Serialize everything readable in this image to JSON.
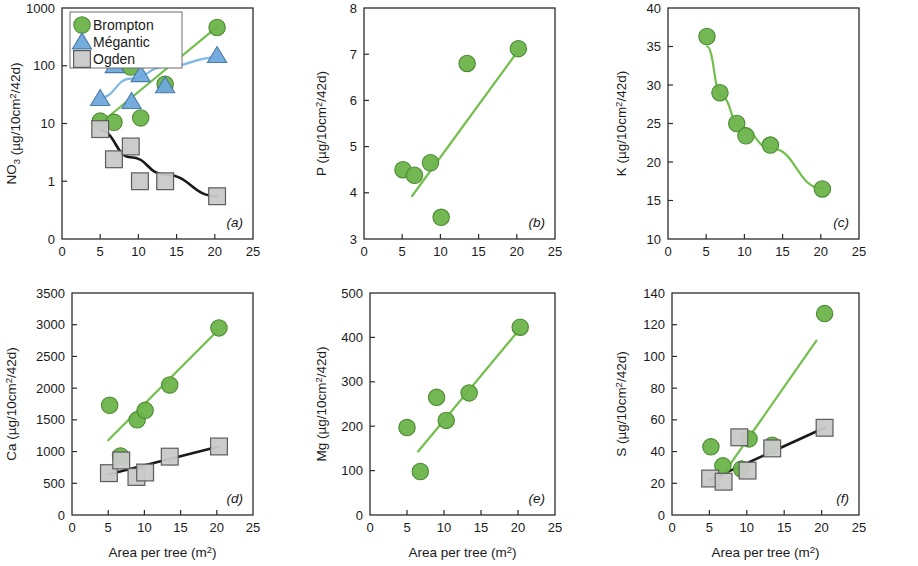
{
  "figure": {
    "xlabel": "Area per tree (m2)",
    "xlabel_base": "Area per tree (m",
    "xlabel_sup": "2",
    "xlabel_tail": ")",
    "unit_suffix": "g/10cm2/42d)",
    "legend": {
      "title": "",
      "items": [
        {
          "label": "Brompton",
          "marker": "circle",
          "color": "#6DB44A"
        },
        {
          "label": "Mégantic",
          "marker": "triangle",
          "color": "#6FA8DC"
        },
        {
          "label": "Ogden",
          "marker": "square",
          "color": "#C9C9C9"
        }
      ]
    }
  },
  "chart_data": [
    {
      "type": "scatter",
      "panel": "(a)",
      "title": "",
      "ylabel": "NO3 (µg/10cm2/42d)",
      "ylabel_parts": {
        "sym": "NO",
        "sub": "3",
        "rest": " (µg/10cm",
        "sup": "2",
        "tail": "/42d)"
      },
      "xlabel": "Area per tree (m2)",
      "xlim": [
        0,
        25
      ],
      "xticks": [
        0,
        5,
        10,
        15,
        20,
        25
      ],
      "yscale": "log-with-zero",
      "yticks": [
        0,
        1,
        10,
        100,
        1000
      ],
      "ytick_labels": [
        "0",
        "1",
        "10",
        "100",
        "1000"
      ],
      "ylim": [
        0.3,
        1000
      ],
      "grid": false,
      "series": [
        {
          "name": "Brompton",
          "marker": "circle",
          "color": "#6DB44A",
          "points": [
            [
              5.0,
              11.0
            ],
            [
              6.8,
              10.5
            ],
            [
              9.0,
              95.0
            ],
            [
              10.3,
              12.5
            ],
            [
              13.5,
              48.0
            ],
            [
              20.3,
              460.0
            ]
          ],
          "fit": {
            "type": "line",
            "x": [
              5.0,
              20.3
            ],
            "y": [
              10.0,
              470.0
            ]
          }
        },
        {
          "name": "Mégantic",
          "marker": "triangle",
          "color": "#6FA8DC",
          "points": [
            [
              5.0,
              27.0
            ],
            [
              6.9,
              100.0
            ],
            [
              9.1,
              24.0
            ],
            [
              10.3,
              70.0
            ],
            [
              13.5,
              45.0
            ],
            [
              20.3,
              150.0
            ]
          ],
          "fit": {
            "type": "curve",
            "x": [
              5.0,
              9.0,
              13.5,
              20.3
            ],
            "y": [
              28.0,
              60.0,
              95.0,
              140.0
            ]
          }
        },
        {
          "name": "Ogden",
          "marker": "square",
          "color": "#C9C9C9",
          "points": [
            [
              5.0,
              8.0
            ],
            [
              6.8,
              2.4
            ],
            [
              9.0,
              4.0
            ],
            [
              10.2,
              1.0
            ],
            [
              13.5,
              1.0
            ],
            [
              20.3,
              0.55
            ]
          ],
          "fit": {
            "type": "curve",
            "x": [
              5.0,
              9.0,
              13.5,
              20.3
            ],
            "y": [
              7.5,
              2.6,
              1.3,
              0.55
            ]
          }
        }
      ]
    },
    {
      "type": "scatter",
      "panel": "(b)",
      "title": "",
      "ylabel": "P (µg/10cm2/42d)",
      "ylabel_parts": {
        "sym": "P",
        "sub": "",
        "rest": " (µg/10cm",
        "sup": "2",
        "tail": "/42d)"
      },
      "xlabel": "Area per tree (m2)",
      "xlim": [
        0,
        25
      ],
      "xticks": [
        0,
        5,
        10,
        15,
        20,
        25
      ],
      "yscale": "linear",
      "ylim": [
        3,
        8
      ],
      "yticks": [
        3,
        4,
        5,
        6,
        7,
        8
      ],
      "ytick_labels": [
        "3",
        "4",
        "5",
        "6",
        "7",
        "8"
      ],
      "grid": false,
      "series": [
        {
          "name": "Brompton",
          "marker": "circle",
          "color": "#6DB44A",
          "points": [
            [
              5.1,
              4.5
            ],
            [
              6.6,
              4.38
            ],
            [
              8.7,
              4.65
            ],
            [
              10.1,
              3.47
            ],
            [
              13.5,
              6.8
            ],
            [
              20.2,
              7.12
            ]
          ],
          "fit": {
            "type": "line",
            "x": [
              6.3,
              20.2
            ],
            "y": [
              3.93,
              7.08
            ]
          }
        }
      ]
    },
    {
      "type": "scatter",
      "panel": "(c)",
      "title": "",
      "ylabel": "K (µg/10cm2/42d)",
      "ylabel_parts": {
        "sym": "K",
        "sub": "",
        "rest": " (µg/10cm",
        "sup": "2",
        "tail": "/42d)"
      },
      "xlabel": "Area per tree (m2)",
      "xlim": [
        0,
        25
      ],
      "xticks": [
        0,
        5,
        10,
        15,
        20,
        25
      ],
      "yscale": "linear",
      "ylim": [
        10,
        40
      ],
      "yticks": [
        10,
        15,
        20,
        25,
        30,
        35,
        40
      ],
      "ytick_labels": [
        "10",
        "15",
        "20",
        "25",
        "30",
        "35",
        "40"
      ],
      "grid": false,
      "series": [
        {
          "name": "Brompton",
          "marker": "circle",
          "color": "#6DB44A",
          "points": [
            [
              5.1,
              36.3
            ],
            [
              6.8,
              29.0
            ],
            [
              9.0,
              25.0
            ],
            [
              10.2,
              23.4
            ],
            [
              13.4,
              22.2
            ],
            [
              20.2,
              16.5
            ]
          ],
          "fit": {
            "type": "curve",
            "x": [
              5.1,
              7.0,
              9.5,
              13.4,
              20.2
            ],
            "y": [
              35.0,
              28.5,
              24.5,
              21.8,
              16.6
            ]
          }
        }
      ]
    },
    {
      "type": "scatter",
      "panel": "(d)",
      "title": "",
      "ylabel": "Ca (µg/10cm2/42d)",
      "ylabel_parts": {
        "sym": "Ca",
        "sub": "",
        "rest": " (µg/10cm",
        "sup": "2",
        "tail": "/42d)"
      },
      "xlabel": "Area per tree (m2)",
      "xlim": [
        0,
        25
      ],
      "xticks": [
        0,
        5,
        10,
        15,
        20,
        25
      ],
      "yscale": "linear",
      "ylim": [
        0,
        3500
      ],
      "yticks": [
        0,
        500,
        1000,
        1500,
        2000,
        2500,
        3000,
        3500
      ],
      "ytick_labels": [
        "0",
        "500",
        "1000",
        "1500",
        "2000",
        "2500",
        "3000",
        "3500"
      ],
      "grid": false,
      "series": [
        {
          "name": "Brompton",
          "marker": "circle",
          "color": "#6DB44A",
          "points": [
            [
              5.2,
              1730
            ],
            [
              6.7,
              930
            ],
            [
              9.0,
              1500
            ],
            [
              10.1,
              1650
            ],
            [
              13.5,
              2050
            ],
            [
              20.3,
              2950
            ]
          ],
          "fit": {
            "type": "line",
            "x": [
              5.0,
              20.3
            ],
            "y": [
              1180,
              2930
            ]
          }
        },
        {
          "name": "Ogden",
          "marker": "square",
          "color": "#C9C9C9",
          "points": [
            [
              5.1,
              660
            ],
            [
              6.8,
              860
            ],
            [
              8.9,
              600
            ],
            [
              10.1,
              670
            ],
            [
              13.5,
              920
            ],
            [
              20.3,
              1080
            ]
          ],
          "fit": {
            "type": "line",
            "x": [
              5.0,
              20.3
            ],
            "y": [
              640,
              1080
            ]
          }
        }
      ]
    },
    {
      "type": "scatter",
      "panel": "(e)",
      "title": "",
      "ylabel": "Mg (µg/10cm2/42d)",
      "ylabel_parts": {
        "sym": "Mg",
        "sub": "",
        "rest": " (µg/10cm",
        "sup": "2",
        "tail": "/42d)"
      },
      "xlabel": "Area per tree (m2)",
      "xlim": [
        0,
        25
      ],
      "xticks": [
        0,
        5,
        10,
        15,
        20,
        25
      ],
      "yscale": "linear",
      "ylim": [
        0,
        500
      ],
      "yticks": [
        0,
        100,
        200,
        300,
        400,
        500
      ],
      "ytick_labels": [
        "0",
        "100",
        "200",
        "300",
        "400",
        "500"
      ],
      "grid": false,
      "series": [
        {
          "name": "Brompton",
          "marker": "circle",
          "color": "#6DB44A",
          "points": [
            [
              5.0,
              197
            ],
            [
              6.8,
              98
            ],
            [
              9.0,
              265
            ],
            [
              10.3,
              213
            ],
            [
              13.4,
              275
            ],
            [
              20.3,
              423
            ]
          ],
          "fit": {
            "type": "line",
            "x": [
              6.5,
              20.3
            ],
            "y": [
              143,
              420
            ]
          }
        }
      ]
    },
    {
      "type": "scatter",
      "panel": "(f)",
      "title": "",
      "ylabel": "S (µg/10cm2/42d)",
      "ylabel_parts": {
        "sym": "S",
        "sub": "",
        "rest": " (µg/10cm",
        "sup": "2",
        "tail": "/42d)"
      },
      "xlabel": "Area per tree (m2)",
      "xlim": [
        0,
        25
      ],
      "xticks": [
        0,
        5,
        10,
        15,
        20,
        25
      ],
      "yscale": "linear",
      "ylim": [
        0,
        140
      ],
      "yticks": [
        0,
        20,
        40,
        60,
        80,
        100,
        120,
        140
      ],
      "ytick_labels": [
        "0",
        "20",
        "40",
        "60",
        "80",
        "100",
        "120",
        "140"
      ],
      "grid": false,
      "series": [
        {
          "name": "Brompton",
          "marker": "circle",
          "color": "#6DB44A",
          "points": [
            [
              5.2,
              43
            ],
            [
              6.8,
              31
            ],
            [
              9.3,
              29
            ],
            [
              10.3,
              48
            ],
            [
              13.4,
              44
            ],
            [
              20.4,
              127
            ]
          ],
          "fit": {
            "type": "line",
            "x": [
              6.3,
              19.3
            ],
            "y": [
              22,
              110
            ]
          }
        },
        {
          "name": "Ogden",
          "marker": "square",
          "color": "#C9C9C9",
          "points": [
            [
              5.1,
              23
            ],
            [
              6.9,
              21
            ],
            [
              9.0,
              49
            ],
            [
              10.1,
              28
            ],
            [
              13.4,
              42
            ],
            [
              20.4,
              55
            ]
          ],
          "fit": {
            "type": "line",
            "x": [
              5.0,
              20.4
            ],
            "y": [
              22,
              55
            ]
          }
        }
      ]
    }
  ]
}
